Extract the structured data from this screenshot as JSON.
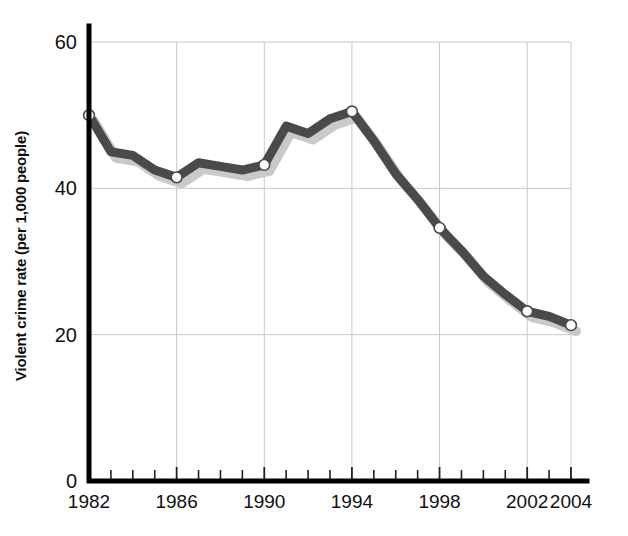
{
  "chart_data": {
    "type": "line",
    "title": "",
    "subtitle": "",
    "xlabel": "",
    "ylabel": "Violent crime rate (per 1,000 people)",
    "xlim": [
      1982,
      2004
    ],
    "ylim": [
      0,
      60
    ],
    "grid": true,
    "legend": false,
    "legend_position": "none",
    "y_ticks": [
      0,
      20,
      40,
      60
    ],
    "y_tick_labels": [
      "0",
      "20",
      "40",
      "60"
    ],
    "x_ticks": [
      1982,
      1986,
      1990,
      1994,
      1998,
      2002,
      2004
    ],
    "x_tick_labels": [
      "1982",
      "1986",
      "1990",
      "1994",
      "1998",
      "2002",
      "2004"
    ],
    "x_minor_ticks": [
      1983,
      1984,
      1985,
      1987,
      1988,
      1989,
      1991,
      1992,
      1993,
      1995,
      1996,
      1997,
      1999,
      2000,
      2001,
      2003
    ],
    "marker_years": [
      1982,
      1986,
      1990,
      1994,
      1998,
      2002,
      2004
    ],
    "series": [
      {
        "name": "Violent crime rate",
        "x": [
          1982,
          1983,
          1984,
          1985,
          1986,
          1987,
          1988,
          1989,
          1990,
          1991,
          1992,
          1993,
          1994,
          1995,
          1996,
          1997,
          1998,
          1999,
          2000,
          2001,
          2002,
          2003,
          2004
        ],
        "values": [
          50.0,
          45.0,
          44.5,
          42.5,
          41.5,
          43.5,
          43.0,
          42.5,
          43.2,
          48.5,
          47.5,
          49.5,
          50.5,
          46.5,
          42.0,
          38.5,
          34.6,
          31.5,
          28.0,
          25.5,
          23.2,
          22.5,
          21.3
        ],
        "color": "#4a4a4a",
        "line_width": 9,
        "marker": "circle",
        "marker_face_color": "#ffffff",
        "shadow_color": "#c9c9c9"
      }
    ]
  },
  "axes": {
    "axis_color": "#000000",
    "grid_color": "#c8c8c8",
    "background": "#ffffff"
  },
  "labels": {
    "y_axis_title": "Violent crime rate (per 1,000 people)"
  }
}
